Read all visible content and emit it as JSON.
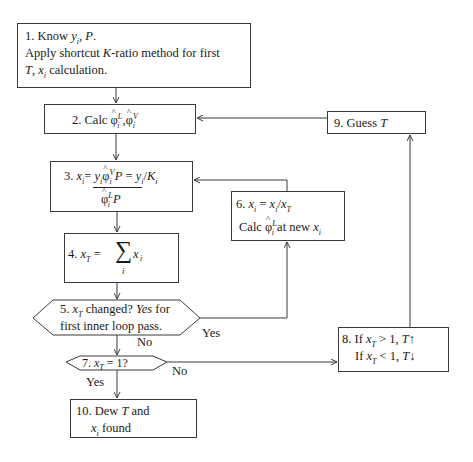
{
  "diagram": {
    "type": "flowchart",
    "nodes": [
      {
        "id": "1",
        "shape": "rect",
        "num": "1.",
        "line1_a": "Know ",
        "line1_y": "y",
        "line1_sub": "i",
        "line1_b": ", ",
        "line1_p": "P",
        "line1_c": ".",
        "line2_a": "Apply shortcut ",
        "line2_k": "K",
        "line2_b": "-ratio method for first",
        "line3_t": "T",
        "line3_a": ", ",
        "line3_x": "x",
        "line3_sub": "i",
        "line3_b": " calculation."
      },
      {
        "id": "2",
        "shape": "rect",
        "num": "2.",
        "text_a": "Calc ",
        "phi": "φ",
        "hat": "^",
        "sup_l": "L",
        "sub_i": "i",
        "sep": " ,",
        "sup_v": "V"
      },
      {
        "id": "3",
        "shape": "rect",
        "num": "3.",
        "x": "x",
        "sub_i": "i",
        "eq": "= ",
        "y": "y",
        "phi": "φ",
        "hat": "^",
        "sup_v": "V",
        "sup_l": "L",
        "p": "P",
        "eq2": " = ",
        "slash": "/",
        "k": "K"
      },
      {
        "id": "4",
        "shape": "rect",
        "num": "4.",
        "x": "x",
        "sub_t": "T",
        "eq": " = ",
        "sigma": "∑",
        "sub_i": "i"
      },
      {
        "id": "5",
        "shape": "hexagon",
        "num": "5.",
        "x": "x",
        "sub_t": "T",
        "text_a": " changed? ",
        "yes": "Yes",
        "text_b": " for",
        "line2": "first inner loop pass."
      },
      {
        "id": "6",
        "shape": "rect",
        "num": "6.",
        "x": "x",
        "sub_i": "i",
        "eq": " = ",
        "slash": "/",
        "sub_t": "T",
        "calc": "Calc ",
        "phi": "φ",
        "hat": "^",
        "sup_l": "L",
        "at_new": " at new "
      },
      {
        "id": "7",
        "shape": "hexagon",
        "num": "7.",
        "x": "x",
        "sub_t": "T",
        "text": " = 1?"
      },
      {
        "id": "8",
        "shape": "rect",
        "num": "8.",
        "if": "If ",
        "x": "x",
        "sub_t": "T",
        "gt": " > 1, ",
        "lt": " < 1, ",
        "t": "T",
        "up": "↑",
        "down": "↓"
      },
      {
        "id": "9",
        "shape": "rect",
        "num": "9.",
        "text": "Guess ",
        "t": "T"
      },
      {
        "id": "10",
        "shape": "rect",
        "num": "10.",
        "text_a": "Dew ",
        "t": "T",
        "text_b": " and",
        "x": "x",
        "sub_i": "i",
        "text_c": " found"
      }
    ],
    "edge_labels": {
      "e5_6": "Yes",
      "e5_7": "No",
      "e7_10": "Yes",
      "e7_8": "No"
    },
    "edges": [
      {
        "from": "1",
        "to": "2"
      },
      {
        "from": "2",
        "to": "3"
      },
      {
        "from": "3",
        "to": "4"
      },
      {
        "from": "4",
        "to": "5"
      },
      {
        "from": "5",
        "to": "6",
        "label": "Yes"
      },
      {
        "from": "6",
        "to": "3"
      },
      {
        "from": "5",
        "to": "7",
        "label": "No"
      },
      {
        "from": "7",
        "to": "10",
        "label": "Yes"
      },
      {
        "from": "7",
        "to": "8",
        "label": "No"
      },
      {
        "from": "8",
        "to": "9"
      },
      {
        "from": "9",
        "to": "2"
      }
    ],
    "colors": {
      "line": "#3a3a3a",
      "text": "#1a1a1a",
      "background": "#ffffff"
    }
  }
}
